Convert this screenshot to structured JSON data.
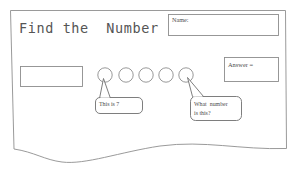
{
  "document": {
    "kind": "math-worksheet",
    "title": "Find the  Number",
    "paper_edge_color": "#888888",
    "ink_color": "#4d4d4d",
    "background": "#ffffff"
  },
  "title_block": {
    "text": "Find the  Number"
  },
  "name_field": {
    "label": "Name:",
    "value": "",
    "placeholder": ""
  },
  "answer_field": {
    "label": "Answer =",
    "value": "",
    "placeholder": ""
  },
  "work_box": {
    "label": "",
    "value": "",
    "placeholder": ""
  },
  "number_line": {
    "count": 5,
    "circles": [
      {
        "index": 1,
        "value": ""
      },
      {
        "index": 2,
        "value": ""
      },
      {
        "index": 3,
        "value": ""
      },
      {
        "index": 4,
        "value": ""
      },
      {
        "index": 5,
        "value": ""
      }
    ]
  },
  "callouts": [
    {
      "id": "left",
      "text": "This is 7",
      "points_to_circle": 1
    },
    {
      "id": "right",
      "line1": "What  number",
      "line2": "is this?",
      "points_to_circle": 5
    }
  ]
}
